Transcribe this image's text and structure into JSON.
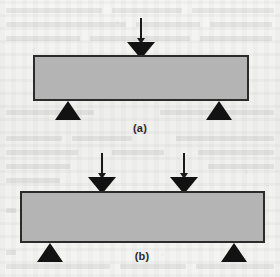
{
  "figure": {
    "background_color": "#f3f3f1",
    "beam_fill_color": "#b4b4b4",
    "beam_border_color": "#2b2b2b",
    "marker_color": "#121212"
  },
  "panels": [
    {
      "id": "a",
      "caption": "(a)",
      "description": "three-point bend: one central load, two end supports",
      "beam": {
        "x": 33,
        "y": 55,
        "width": 216,
        "height": 46
      },
      "loads": [
        {
          "name": "center-load",
          "x": 127,
          "y": 18,
          "shaft_length": 20,
          "label": ""
        }
      ],
      "supports": [
        {
          "name": "left-support",
          "x": 55,
          "y": 101
        },
        {
          "name": "right-support",
          "x": 206,
          "y": 101
        }
      ],
      "caption_pos": {
        "x": 140,
        "y": 122
      }
    },
    {
      "id": "b",
      "caption": "(b)",
      "description": "four-point bend: two symmetric loads, two end supports",
      "beam": {
        "x": 20,
        "y": 191,
        "width": 245,
        "height": 52
      },
      "loads": [
        {
          "name": "left-load",
          "x": 88,
          "y": 153,
          "shaft_length": 20,
          "label": ""
        },
        {
          "name": "right-load",
          "x": 170,
          "y": 153,
          "shaft_length": 20,
          "label": ""
        }
      ],
      "supports": [
        {
          "name": "left-support",
          "x": 37,
          "y": 243
        },
        {
          "name": "right-support",
          "x": 221,
          "y": 243
        }
      ],
      "caption_pos": {
        "x": 142,
        "y": 250
      }
    }
  ],
  "ghost_lines": [
    {
      "x": 6,
      "y": 8,
      "w": 96
    },
    {
      "x": 112,
      "y": 8,
      "w": 70
    },
    {
      "x": 192,
      "y": 8,
      "w": 82
    },
    {
      "x": 6,
      "y": 22,
      "w": 120
    },
    {
      "x": 136,
      "y": 22,
      "w": 64
    },
    {
      "x": 210,
      "y": 22,
      "w": 62
    },
    {
      "x": 6,
      "y": 36,
      "w": 74
    },
    {
      "x": 90,
      "y": 36,
      "w": 100
    },
    {
      "x": 200,
      "y": 36,
      "w": 72
    },
    {
      "x": 6,
      "y": 110,
      "w": 88
    },
    {
      "x": 160,
      "y": 110,
      "w": 114
    },
    {
      "x": 6,
      "y": 136,
      "w": 56
    },
    {
      "x": 72,
      "y": 136,
      "w": 60
    },
    {
      "x": 176,
      "y": 136,
      "w": 98
    },
    {
      "x": 6,
      "y": 150,
      "w": 72
    },
    {
      "x": 112,
      "y": 150,
      "w": 52
    },
    {
      "x": 198,
      "y": 150,
      "w": 76
    },
    {
      "x": 6,
      "y": 164,
      "w": 64
    },
    {
      "x": 208,
      "y": 164,
      "w": 66
    },
    {
      "x": 6,
      "y": 178,
      "w": 54
    },
    {
      "x": 6,
      "y": 208,
      "w": 10
    },
    {
      "x": 6,
      "y": 250,
      "w": 10
    },
    {
      "x": 6,
      "y": 264,
      "w": 104
    },
    {
      "x": 120,
      "y": 264,
      "w": 66
    },
    {
      "x": 196,
      "y": 264,
      "w": 78
    }
  ]
}
